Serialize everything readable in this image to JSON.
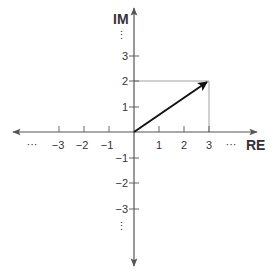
{
  "diagram": {
    "type": "complex-plane",
    "axes": {
      "real_label": "RE",
      "imag_label": "IM",
      "x_ticks": [
        {
          "value": -3,
          "label": "−3"
        },
        {
          "value": -2,
          "label": "−2"
        },
        {
          "value": -1,
          "label": "−1"
        },
        {
          "value": 1,
          "label": "1"
        },
        {
          "value": 2,
          "label": "2"
        },
        {
          "value": 3,
          "label": "3"
        }
      ],
      "y_ticks": [
        {
          "value": 3,
          "label": "3"
        },
        {
          "value": 2,
          "label": "2"
        },
        {
          "value": 1,
          "label": "1"
        },
        {
          "value": -1,
          "label": "−1"
        },
        {
          "value": -2,
          "label": "−2"
        },
        {
          "value": -3,
          "label": "−3"
        }
      ],
      "x_ellipsis": "···",
      "y_ellipsis": "⋮"
    },
    "vector": {
      "re": 3,
      "im": 2,
      "label": "3 + 2i"
    },
    "projection_lines": true,
    "colors": {
      "axis": "#555555",
      "vector": "#111111",
      "guide": "#888888",
      "text": "#333333"
    }
  }
}
